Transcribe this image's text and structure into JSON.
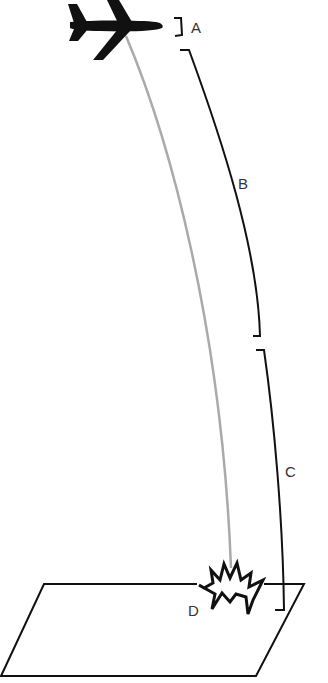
{
  "diagram": {
    "type": "flight-phase-diagram",
    "labels": {
      "a": "A",
      "b": "B",
      "c": "C",
      "d": "D"
    },
    "icons": {
      "airplane": "airplane-icon",
      "explosion": "explosion-icon",
      "ground": "ground-plane"
    },
    "colors": {
      "ink": "#111111",
      "trajectory": "#aaaaaa",
      "label": "#333333",
      "background": "#ffffff"
    }
  }
}
